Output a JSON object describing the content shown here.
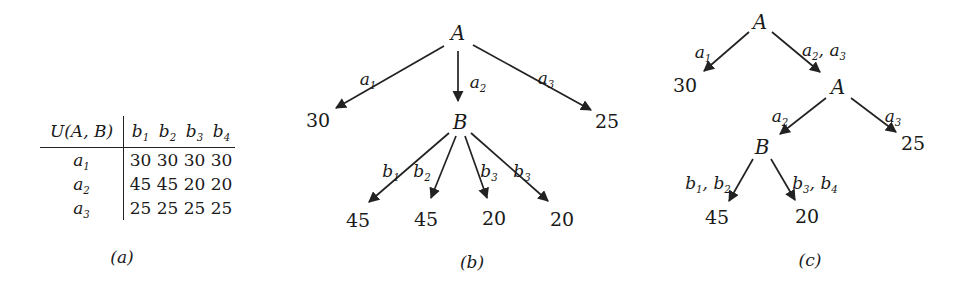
{
  "panel_a": {
    "caption": "(a)",
    "table": {
      "corner": "U(A, B)",
      "cols": [
        "b1",
        "b2",
        "b3",
        "b4"
      ],
      "rows": [
        {
          "label": "a1",
          "values": [
            "30",
            "30",
            "30",
            "30"
          ]
        },
        {
          "label": "a2",
          "values": [
            "45",
            "45",
            "20",
            "20"
          ]
        },
        {
          "label": "a3",
          "values": [
            "25",
            "25",
            "25",
            "25"
          ]
        }
      ]
    }
  },
  "panel_b": {
    "caption": "(b)",
    "root": "A",
    "edge_labels": [
      "a1",
      "a2",
      "a3"
    ],
    "left_leaf": "30",
    "mid_node": "B",
    "right_leaf": "25",
    "b_edge_labels": [
      "b1",
      "b2",
      "b3",
      "b3"
    ],
    "b_leaves": [
      "45",
      "45",
      "20",
      "20"
    ]
  },
  "panel_c": {
    "caption": "(c)",
    "root": "A",
    "edge_a1": "a1",
    "edge_a2a3": "a2, a3",
    "leaf_a1": "30",
    "inner_a": "A",
    "edge_a2": "a2",
    "edge_a3": "a3",
    "node_b": "B",
    "leaf_a3": "25",
    "edge_b1b2": "b1, b2",
    "edge_b3b4": "b3, b4",
    "leaf_b12": "45",
    "leaf_b34": "20"
  }
}
